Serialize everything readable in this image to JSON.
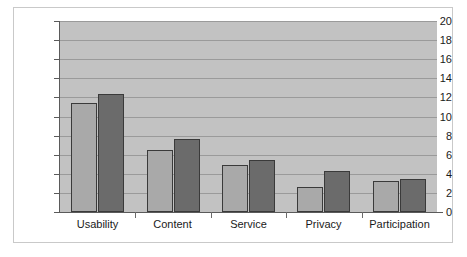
{
  "chart_data": {
    "type": "bar",
    "title": "",
    "subtitle": "",
    "xlabel": "",
    "ylabel": "",
    "categories": [
      "Usability",
      "Content",
      "Service",
      "Privacy",
      "Participation"
    ],
    "series": [
      {
        "name": "Series 1",
        "color": "#a9a9a9",
        "values": [
          11.4,
          6.5,
          4.9,
          2.6,
          3.2
        ]
      },
      {
        "name": "Series 2",
        "color": "#6b6b6b",
        "values": [
          12.4,
          7.6,
          5.4,
          4.3,
          3.5
        ]
      }
    ],
    "ylim": [
      0,
      20
    ],
    "ytick_step": 2,
    "yticks": [
      0,
      2,
      4,
      6,
      8,
      10,
      12,
      14,
      16,
      18,
      20
    ],
    "ytick_labels": [
      "0",
      "2",
      "4",
      "6",
      "8",
      "10",
      "12",
      "14",
      "16",
      "18",
      "20"
    ],
    "grid": true,
    "grid_axis": "y",
    "legend": false,
    "legend_position": "none",
    "plot_background": "#c2c2c2",
    "figure_background": "#ffffff",
    "bar_edge_color": "#3a3a3a",
    "annotations": []
  }
}
